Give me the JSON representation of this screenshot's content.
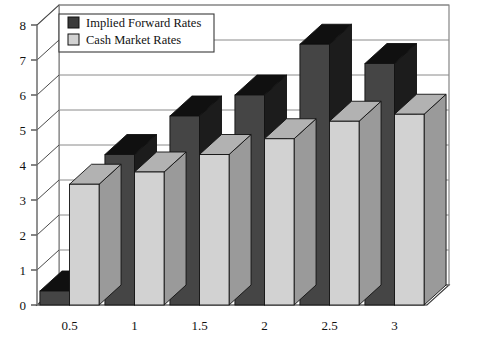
{
  "chart_data": {
    "type": "bar",
    "title": "",
    "subtitle": "",
    "xlabel": "",
    "ylabel": "",
    "categories": [
      "0.5",
      "1",
      "1.5",
      "2",
      "2.5",
      "3"
    ],
    "series": [
      {
        "name": "Implied Forward Rates",
        "color": "#454545",
        "values": [
          0.4,
          4.3,
          5.4,
          6.0,
          7.45,
          6.9
        ]
      },
      {
        "name": "Cash Market Rates",
        "color": "#d2d2d2",
        "values": [
          3.45,
          3.8,
          4.3,
          4.75,
          5.25,
          5.45
        ]
      }
    ],
    "ylim": [
      0,
      8
    ],
    "yticks": [
      "0",
      "1",
      "2",
      "3",
      "4",
      "5",
      "6",
      "7",
      "8"
    ],
    "xticks": [
      "0.5",
      "1",
      "1.5",
      "2",
      "2.5",
      "3"
    ],
    "grid": true,
    "grid_axis": "y",
    "legend_position": "top-left",
    "projection": "3d",
    "legend": [
      {
        "label": "Implied Forward Rates",
        "swatch": "#3a3a3a"
      },
      {
        "label": "Cash Market Rates",
        "swatch": "#d2d2d2"
      }
    ]
  },
  "colors": {
    "background": "#ffffff",
    "dark_front": "#454545",
    "dark_top": "#101010",
    "dark_side": "#1c1c1c",
    "light_front": "#d2d2d2",
    "light_top": "#b2b2b2",
    "light_side": "#9a9a9a",
    "grid": "#8a8a8a",
    "frame": "#7a7a7a",
    "text": "#111111"
  }
}
